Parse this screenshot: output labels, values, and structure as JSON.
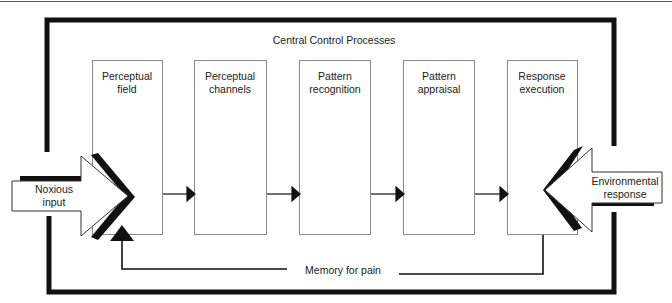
{
  "diagram": {
    "title": "Central Control Processes",
    "boxes": [
      {
        "line1": "Perceptual",
        "line2": "field"
      },
      {
        "line1": "Perceptual",
        "line2": "channels"
      },
      {
        "line1": "Pattern",
        "line2": "recognition"
      },
      {
        "line1": "Pattern",
        "line2": "appraisal"
      },
      {
        "line1": "Response",
        "line2": "execution"
      }
    ],
    "input_arrow": {
      "line1": "Noxious",
      "line2": "input"
    },
    "output_arrow": {
      "line1": "Environmental",
      "line2": "response"
    },
    "feedback_label": "Memory for pain",
    "colors": {
      "line": "#111111",
      "box_border": "#888888",
      "background": "#ffffff"
    }
  }
}
